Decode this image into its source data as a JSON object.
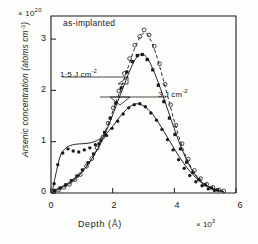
{
  "chart_data": {
    "type": "line",
    "title": "",
    "xlabel": "Depth  (Å)",
    "x_multiplier": "× 10",
    "x_multiplier_exp": "3",
    "ylabel": "Arsenic concentration (atoms cm",
    "ylabel_exp": "-3",
    "ylabel_tail": ")",
    "y_multiplier": "× 10",
    "y_multiplier_exp": "20",
    "xlim": [
      0,
      6
    ],
    "ylim": [
      0,
      3.45
    ],
    "xticks": [
      0,
      2,
      4,
      6
    ],
    "xticklabels": [
      "0",
      "2",
      "4",
      "6"
    ],
    "yticks": [
      0,
      1,
      2,
      3
    ],
    "yticklabels": [
      "0",
      "1",
      "2",
      "3"
    ],
    "grid": false,
    "legend_position": "inline-annotations",
    "annotations": [
      {
        "name": "as-implanted",
        "text": "as-implanted",
        "x": 0.55,
        "y": 3.25
      },
      {
        "name": "1.5 J cm-2",
        "text": "1·5 J cm",
        "exp": "-2",
        "x": 0.55,
        "y": 2.28
      },
      {
        "name": "3 J cm-2",
        "text": "3 J cm",
        "exp": "-2",
        "x": 3.15,
        "y": 1.95
      }
    ],
    "series": [
      {
        "name": "as-implanted",
        "marker": "open-circle",
        "line": "dashed",
        "x": [
          0.05,
          0.15,
          0.3,
          0.5,
          0.7,
          0.9,
          1.1,
          1.3,
          1.5,
          1.7,
          1.9,
          2.1,
          2.3,
          2.5,
          2.7,
          2.9,
          3.05,
          3.2,
          3.4,
          3.6,
          3.8,
          4.0,
          4.2,
          4.4,
          4.6,
          4.8,
          5.0,
          5.2,
          5.4,
          5.6
        ],
        "values": [
          0.02,
          0.04,
          0.08,
          0.14,
          0.22,
          0.33,
          0.47,
          0.64,
          0.86,
          1.12,
          1.42,
          1.76,
          2.1,
          2.45,
          2.8,
          3.05,
          3.12,
          3.02,
          2.72,
          2.3,
          1.85,
          1.4,
          1.0,
          0.68,
          0.44,
          0.27,
          0.16,
          0.1,
          0.06,
          0.03
        ]
      },
      {
        "name": "1·5 J cm-2",
        "marker": "filled-square",
        "line": "solid",
        "x": [
          0.05,
          0.2,
          0.4,
          0.6,
          0.8,
          1.0,
          1.2,
          1.4,
          1.6,
          1.8,
          2.0,
          2.2,
          2.4,
          2.6,
          2.75,
          2.9,
          3.05,
          3.2,
          3.4,
          3.6,
          3.8,
          4.0,
          4.2,
          4.4,
          4.6,
          4.8,
          5.0,
          5.2,
          5.4,
          5.6
        ],
        "values": [
          0.03,
          0.07,
          0.13,
          0.2,
          0.29,
          0.41,
          0.56,
          0.74,
          0.96,
          1.22,
          1.52,
          1.84,
          2.15,
          2.45,
          2.62,
          2.7,
          2.68,
          2.55,
          2.28,
          1.95,
          1.6,
          1.25,
          0.92,
          0.64,
          0.42,
          0.26,
          0.16,
          0.1,
          0.06,
          0.03
        ]
      },
      {
        "name": "3 J cm-2",
        "marker": "filled-circle",
        "line": "solid",
        "x": [
          0.05,
          0.15,
          0.3,
          0.45,
          0.6,
          0.8,
          1.0,
          1.2,
          1.4,
          1.6,
          1.8,
          2.0,
          2.2,
          2.4,
          2.6,
          2.8,
          3.0,
          3.2,
          3.4,
          3.6,
          3.8,
          4.0,
          4.2,
          4.4,
          4.6,
          4.8,
          5.0,
          5.2,
          5.4,
          5.6
        ],
        "values": [
          0.06,
          0.35,
          0.72,
          0.86,
          0.92,
          0.95,
          0.96,
          0.97,
          1.0,
          1.06,
          1.16,
          1.3,
          1.46,
          1.6,
          1.7,
          1.74,
          1.7,
          1.6,
          1.45,
          1.26,
          1.06,
          0.86,
          0.67,
          0.5,
          0.36,
          0.24,
          0.15,
          0.09,
          0.05,
          0.03
        ]
      }
    ],
    "scatter_as_implanted": [
      [
        0.1,
        0.03
      ],
      [
        0.25,
        0.06
      ],
      [
        0.42,
        0.11
      ],
      [
        0.6,
        0.17
      ],
      [
        0.78,
        0.26
      ],
      [
        0.95,
        0.36
      ],
      [
        1.15,
        0.52
      ],
      [
        1.32,
        0.67
      ],
      [
        1.5,
        0.88
      ],
      [
        1.68,
        1.09
      ],
      [
        1.85,
        1.36
      ],
      [
        2.02,
        1.66
      ],
      [
        2.2,
        1.99
      ],
      [
        2.38,
        2.33
      ],
      [
        2.55,
        2.62
      ],
      [
        2.72,
        2.88
      ],
      [
        2.88,
        3.05
      ],
      [
        3.02,
        3.18
      ],
      [
        3.18,
        3.08
      ],
      [
        3.35,
        2.86
      ],
      [
        3.52,
        2.52
      ],
      [
        3.7,
        2.12
      ],
      [
        3.88,
        1.72
      ],
      [
        4.05,
        1.32
      ],
      [
        4.25,
        0.96
      ],
      [
        4.45,
        0.66
      ],
      [
        4.65,
        0.44
      ],
      [
        4.85,
        0.28
      ],
      [
        5.05,
        0.17
      ],
      [
        5.25,
        0.11
      ],
      [
        5.45,
        0.06
      ],
      [
        5.6,
        0.04
      ]
    ],
    "scatter_1p5": [
      [
        0.12,
        0.05
      ],
      [
        0.3,
        0.1
      ],
      [
        0.48,
        0.16
      ],
      [
        0.66,
        0.24
      ],
      [
        0.84,
        0.33
      ],
      [
        1.02,
        0.45
      ],
      [
        1.2,
        0.59
      ],
      [
        1.38,
        0.76
      ],
      [
        1.56,
        0.96
      ],
      [
        1.74,
        1.18
      ],
      [
        1.92,
        1.46
      ],
      [
        2.1,
        1.75
      ],
      [
        2.28,
        2.05
      ],
      [
        2.46,
        2.36
      ],
      [
        2.64,
        2.56
      ],
      [
        2.8,
        2.68
      ],
      [
        2.96,
        2.7
      ],
      [
        3.12,
        2.6
      ],
      [
        3.3,
        2.4
      ],
      [
        3.48,
        2.1
      ],
      [
        3.66,
        1.78
      ],
      [
        3.84,
        1.46
      ],
      [
        4.02,
        1.14
      ],
      [
        4.2,
        0.86
      ],
      [
        4.4,
        0.6
      ],
      [
        4.6,
        0.4
      ],
      [
        4.8,
        0.26
      ],
      [
        5.0,
        0.16
      ],
      [
        5.2,
        0.1
      ],
      [
        5.4,
        0.06
      ]
    ],
    "scatter_3": [
      [
        0.1,
        0.18
      ],
      [
        0.22,
        0.55
      ],
      [
        0.38,
        0.78
      ],
      [
        0.55,
        0.86
      ],
      [
        0.72,
        0.82
      ],
      [
        0.9,
        0.8
      ],
      [
        1.08,
        0.84
      ],
      [
        1.26,
        0.88
      ],
      [
        1.44,
        0.94
      ],
      [
        1.62,
        1.02
      ],
      [
        1.8,
        1.12
      ],
      [
        1.98,
        1.26
      ],
      [
        2.16,
        1.4
      ],
      [
        2.34,
        1.54
      ],
      [
        2.52,
        1.66
      ],
      [
        2.7,
        1.72
      ],
      [
        2.88,
        1.74
      ],
      [
        3.06,
        1.68
      ],
      [
        3.24,
        1.56
      ],
      [
        3.42,
        1.42
      ],
      [
        3.6,
        1.24
      ],
      [
        3.78,
        1.04
      ],
      [
        3.96,
        0.84
      ],
      [
        4.14,
        0.65
      ],
      [
        4.32,
        0.48
      ],
      [
        4.5,
        0.34
      ],
      [
        4.7,
        0.22
      ],
      [
        4.9,
        0.14
      ],
      [
        5.1,
        0.08
      ],
      [
        5.3,
        0.05
      ]
    ]
  }
}
